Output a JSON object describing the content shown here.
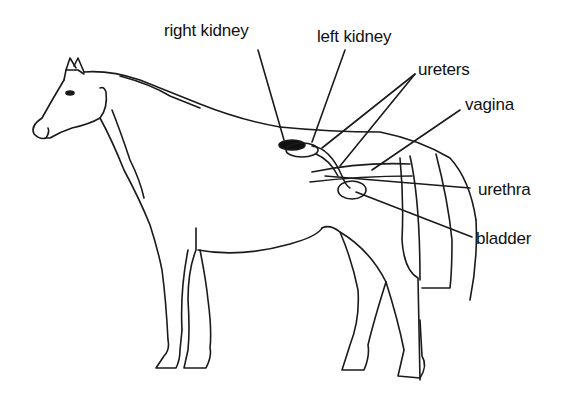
{
  "figure": {
    "labels": [
      {
        "id": "right_kidney",
        "text": "right kidney"
      },
      {
        "id": "left_kidney",
        "text": "left kidney"
      },
      {
        "id": "ureters",
        "text": "ureters"
      },
      {
        "id": "vagina",
        "text": "vagina"
      },
      {
        "id": "urethra",
        "text": "urethra"
      },
      {
        "id": "bladder",
        "text": "bladder"
      }
    ]
  },
  "colors": {
    "line": "#1a1a1a",
    "background": "#ffffff"
  }
}
